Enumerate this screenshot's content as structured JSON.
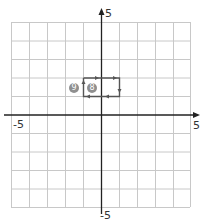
{
  "grid": {
    "x_min": -5,
    "x_max": 5,
    "y_min": -5,
    "y_max": 5,
    "gridline_color": "#c8c8c8",
    "axis_color": "#222222"
  },
  "axis_labels": {
    "y_top": "5",
    "y_bottom": "-5",
    "x_left": "-5",
    "x_right": "5"
  },
  "path": {
    "points": [
      [
        -1,
        2
      ],
      [
        1,
        2
      ],
      [
        1,
        1
      ],
      [
        -1,
        1
      ],
      [
        -1,
        2
      ]
    ],
    "color": "#555555"
  },
  "badges": [
    {
      "label": "9",
      "x": -2.5,
      "y": 1.5
    },
    {
      "label": "8",
      "x": -0.5,
      "y": 1.5
    }
  ]
}
